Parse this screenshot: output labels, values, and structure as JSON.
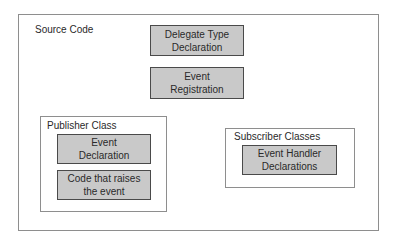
{
  "diagram": {
    "container": {
      "label": "Source Code"
    },
    "boxes": {
      "delegate_type": {
        "label": "Delegate Type\nDeclaration"
      },
      "event_registration": {
        "label": "Event\nRegistration"
      }
    },
    "publisher": {
      "label": "Publisher Class",
      "boxes": {
        "event_declaration": {
          "label": "Event\nDeclaration"
        },
        "raise_event": {
          "label": "Code that raises\nthe event"
        }
      }
    },
    "subscriber": {
      "label": "Subscriber Classes",
      "boxes": {
        "event_handler": {
          "label": "Event Handler\nDeclarations"
        }
      }
    },
    "colors": {
      "box_fill": "#c9c9c9",
      "box_border": "#4a4a4a",
      "frame_border": "#8e8e8e",
      "background": "#ffffff"
    }
  }
}
